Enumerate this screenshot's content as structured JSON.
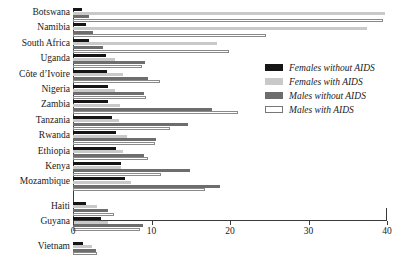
{
  "chart_data": {
    "type": "bar",
    "orientation": "horizontal",
    "grouped": true,
    "title": "",
    "subtitle": "",
    "xlabel": "",
    "ylabel": "",
    "xlim": [
      0,
      40
    ],
    "ylim": null,
    "grid": false,
    "xticks": [
      0,
      10,
      20,
      30,
      40
    ],
    "xtick_labels": [
      "0",
      "10",
      "20",
      "30",
      "40"
    ],
    "legend_position": "right",
    "categories": [
      "Botswana",
      "Namibia",
      "South Africa",
      "Uganda",
      "Côte d’Ivoire",
      "Nigeria",
      "Zambia",
      "Tanzania",
      "Rwanda",
      "Ethiopia",
      "Kenya",
      "Mozambique",
      "Haiti",
      "Guyana",
      "Vietnam"
    ],
    "series": [
      {
        "name": "Females without AIDS",
        "color": "#151515",
        "values": [
          1.1,
          1.6,
          2.0,
          4.2,
          4.3,
          4.5,
          4.5,
          5.0,
          5.5,
          5.5,
          6.1,
          6.6,
          1.7,
          3.6,
          1.3
        ]
      },
      {
        "name": "Females with AIDS",
        "color": "#c9c9c9",
        "values": [
          39.8,
          37.5,
          18.4,
          5.4,
          6.4,
          5.4,
          6.0,
          5.9,
          6.9,
          6.4,
          6.1,
          7.4,
          3.0,
          4.5,
          2.4
        ]
      },
      {
        "name": "Males without AIDS",
        "color": "#6d6d6d",
        "values": [
          2.0,
          2.5,
          3.8,
          9.2,
          9.6,
          9.0,
          17.7,
          14.6,
          10.6,
          9.1,
          14.9,
          18.7,
          4.4,
          8.9,
          2.9
        ]
      },
      {
        "name": "Males with AIDS",
        "color": "#ffffff",
        "values": [
          39.5,
          24.6,
          19.9,
          8.8,
          11.1,
          9.3,
          21.0,
          12.4,
          10.5,
          9.6,
          11.2,
          16.8,
          5.2,
          8.5,
          3.0
        ]
      }
    ],
    "group_gaps_after": [
      "Mozambique",
      "Guyana"
    ]
  },
  "legend": {
    "items": [
      {
        "label": "Females without AIDS",
        "swatch": "s0"
      },
      {
        "label": "Females with AIDS",
        "swatch": "s1"
      },
      {
        "label": "Males without AIDS",
        "swatch": "s2"
      },
      {
        "label": "Males with AIDS",
        "swatch": "s3"
      }
    ]
  }
}
